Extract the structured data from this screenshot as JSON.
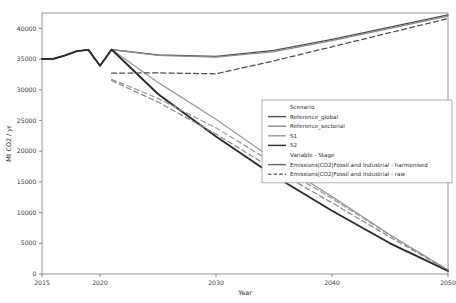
{
  "chart_data": {
    "type": "line",
    "title": "",
    "xlabel": "Year",
    "ylabel": "Mt CO2 / yr",
    "xlim": [
      2015,
      2050
    ],
    "ylim": [
      0,
      42500
    ],
    "xticks": [
      2015,
      2020,
      2030,
      2040,
      2050
    ],
    "xticklabels": [
      "2015",
      "2020",
      "2030",
      "2040",
      "2050"
    ],
    "yticks": [
      0,
      5000,
      10000,
      15000,
      20000,
      25000,
      30000,
      35000,
      40000
    ],
    "yticklabels": [
      "0",
      "5000",
      "10000",
      "15000",
      "20000",
      "25000",
      "30000",
      "35000",
      "40000"
    ],
    "grid": false,
    "legend_position": "center-right",
    "legend": {
      "group1_title": "Scenario",
      "group1_items": [
        {
          "label": "Reference_global",
          "color": "#4d4d4d"
        },
        {
          "label": "Reference_sectorial",
          "color": "#8a8a8a"
        },
        {
          "label": "S1",
          "color": "#9a9a9a"
        },
        {
          "label": "S2",
          "color": "#2a2a2a"
        }
      ],
      "group2_title": "Variable - Stage",
      "group2_items": [
        {
          "label": "Emissions|CO2|Fossil and Industrial - harmonised",
          "style": "solid"
        },
        {
          "label": "Emissions|CO2|Fossil and Industrial - raw",
          "style": "dashed"
        }
      ]
    },
    "series": [
      {
        "name": "Reference_global - harmonised",
        "scenario": "Reference_global",
        "stage": "harmonised",
        "color": "#4d4d4d",
        "style": "solid",
        "x": [
          2015,
          2016,
          2017,
          2018,
          2019,
          2020,
          2021,
          2025,
          2030,
          2035,
          2040,
          2045,
          2050
        ],
        "y": [
          35000,
          35050,
          35600,
          36300,
          36500,
          33900,
          36550,
          35700,
          35450,
          36400,
          38200,
          40200,
          42200
        ]
      },
      {
        "name": "Reference_sectorial - harmonised",
        "scenario": "Reference_sectorial",
        "stage": "harmonised",
        "color": "#8a8a8a",
        "style": "solid",
        "x": [
          2015,
          2016,
          2017,
          2018,
          2019,
          2020,
          2021,
          2025,
          2030,
          2035,
          2040,
          2045,
          2050
        ],
        "y": [
          35000,
          35050,
          35600,
          36300,
          36500,
          33900,
          36550,
          35600,
          35300,
          36200,
          38000,
          40000,
          42000
        ]
      },
      {
        "name": "S1 - harmonised",
        "scenario": "S1",
        "stage": "harmonised",
        "color": "#9a9a9a",
        "style": "solid",
        "x": [
          2015,
          2016,
          2017,
          2018,
          2019,
          2020,
          2021,
          2025,
          2030,
          2035,
          2040,
          2045,
          2050
        ],
        "y": [
          35000,
          35050,
          35600,
          36300,
          36500,
          33900,
          36550,
          31200,
          25200,
          18600,
          12600,
          6400,
          600
        ]
      },
      {
        "name": "S2 - harmonised",
        "scenario": "S2",
        "stage": "harmonised",
        "color": "#2a2a2a",
        "style": "solid",
        "x": [
          2015,
          2016,
          2017,
          2018,
          2019,
          2020,
          2021,
          2025,
          2030,
          2035,
          2040,
          2045,
          2050
        ],
        "y": [
          35000,
          35050,
          35600,
          36300,
          36500,
          33900,
          36550,
          29300,
          22400,
          16000,
          10300,
          5000,
          500
        ]
      },
      {
        "name": "Reference_global - raw",
        "scenario": "Reference_global",
        "stage": "raw",
        "color": "#4d4d4d",
        "style": "dashed",
        "x": [
          2021,
          2025,
          2030,
          2035,
          2040,
          2045,
          2050
        ],
        "y": [
          32700,
          32750,
          32600,
          34700,
          37000,
          39300,
          41600
        ]
      },
      {
        "name": "S1 - raw",
        "scenario": "S1",
        "stage": "raw",
        "color": "#9a9a9a",
        "style": "dashed",
        "x": [
          2021,
          2025,
          2030,
          2035,
          2040,
          2045,
          2050
        ],
        "y": [
          31700,
          28600,
          23800,
          18000,
          12300,
          6300,
          700
        ]
      },
      {
        "name": "S2 - raw",
        "scenario": "S2",
        "stage": "raw",
        "color": "#8a8a8a",
        "style": "dashed",
        "x": [
          2021,
          2025,
          2030,
          2035,
          2040,
          2045,
          2050
        ],
        "y": [
          31500,
          28000,
          22800,
          17000,
          11600,
          6000,
          650
        ]
      }
    ]
  }
}
